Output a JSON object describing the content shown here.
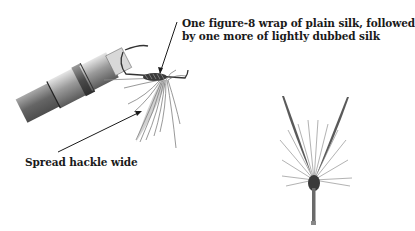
{
  "annotations": {
    "silk_wrap": {
      "line1": "One figure-8 wrap of plain silk, followed",
      "line2": "by one more of lightly dubbed silk"
    },
    "hackle": {
      "text": "Spread hackle wide"
    }
  },
  "illustrations": [
    {
      "name": "vise-with-fly",
      "description": "Fly held in vise jaws with hackle and dubbed silk wrap"
    },
    {
      "name": "finished-spider-fly",
      "description": "Front view of fly with splayed hackle fibers and upright wings"
    }
  ],
  "colors": {
    "ink": "#1a1a1a",
    "metal_dark": "#4a4a4a",
    "metal_light": "#c8c8c8",
    "hackle": "#6a6a6a",
    "background": "#ffffff"
  }
}
